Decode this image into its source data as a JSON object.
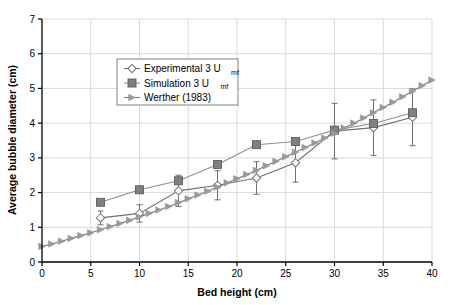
{
  "chart_data": {
    "type": "line",
    "title": "",
    "xlabel": "Bed height (cm)",
    "ylabel": "Average bubble diameter (cm)",
    "xlim": [
      0,
      40
    ],
    "ylim": [
      0,
      7
    ],
    "xticks": [
      0,
      5,
      10,
      15,
      20,
      25,
      30,
      35,
      40
    ],
    "yticks": [
      0,
      1,
      2,
      3,
      4,
      5,
      6,
      7
    ],
    "grid": true,
    "legend_position": "upper-left-inside",
    "series": [
      {
        "name": "Experimental 3 U_mf",
        "legend_label": "Experimental 3 U",
        "legend_sub": "mf",
        "marker": "diamond-open",
        "color": "#808080",
        "line_color": "#707070",
        "has_error_bars": true,
        "x": [
          6,
          10,
          14,
          18,
          22,
          26,
          30,
          34,
          38
        ],
        "values": [
          1.27,
          1.4,
          2.05,
          2.21,
          2.42,
          2.86,
          3.77,
          3.87,
          4.17
        ],
        "err_low": [
          0.2,
          0.25,
          0.45,
          0.42,
          0.47,
          0.56,
          0.8,
          0.8,
          0.82
        ],
        "err_high": [
          0.2,
          0.25,
          0.45,
          0.42,
          0.47,
          0.56,
          0.8,
          0.8,
          0.82
        ]
      },
      {
        "name": "Simulation 3 U_mf",
        "legend_label": "Simulation 3 U",
        "legend_sub": "mf",
        "marker": "square-filled",
        "color": "#808080",
        "line_color": "#909090",
        "has_error_bars": false,
        "x": [
          6,
          10,
          14,
          18,
          22,
          26,
          30,
          34,
          38
        ],
        "values": [
          1.72,
          2.08,
          2.34,
          2.81,
          3.38,
          3.47,
          3.8,
          3.99,
          4.3
        ]
      },
      {
        "name": "Werther (1983)",
        "legend_label": "Werther (1983)",
        "legend_sub": "",
        "marker": "triangle-filled",
        "color": "#999999",
        "line_color": "#777777",
        "has_error_bars": false,
        "x": [
          0,
          1,
          2,
          3,
          4,
          5,
          6,
          7,
          8,
          9,
          10,
          11,
          12,
          13,
          14,
          15,
          16,
          17,
          18,
          19,
          20,
          21,
          22,
          23,
          24,
          25,
          26,
          27,
          28,
          29,
          30,
          31,
          32,
          33,
          34,
          35,
          36,
          37,
          38,
          39,
          40
        ],
        "values": [
          0.45,
          0.52,
          0.6,
          0.68,
          0.76,
          0.84,
          0.93,
          1.02,
          1.11,
          1.2,
          1.3,
          1.4,
          1.5,
          1.6,
          1.71,
          1.82,
          1.93,
          2.04,
          2.16,
          2.28,
          2.4,
          2.52,
          2.64,
          2.77,
          2.9,
          3.03,
          3.16,
          3.3,
          3.43,
          3.57,
          3.71,
          3.86,
          4.0,
          4.15,
          4.3,
          4.45,
          4.6,
          4.76,
          4.92,
          5.08,
          5.24
        ]
      }
    ]
  },
  "legend": {
    "entries": [
      {
        "label": "Experimental 3 U",
        "sub": "mf",
        "marker": "diamond-open"
      },
      {
        "label": "Simulation 3 U",
        "sub": "mf",
        "marker": "square-filled"
      },
      {
        "label": "Werther (1983)",
        "sub": "",
        "marker": "triangle-filled"
      }
    ]
  },
  "colors": {
    "axis": "#000000",
    "grid": "#d9d9d9",
    "experimental": "#808080",
    "simulation": "#8c8c8c",
    "werther": "#999999",
    "background": "#ffffff",
    "legend_border": "#808080"
  }
}
